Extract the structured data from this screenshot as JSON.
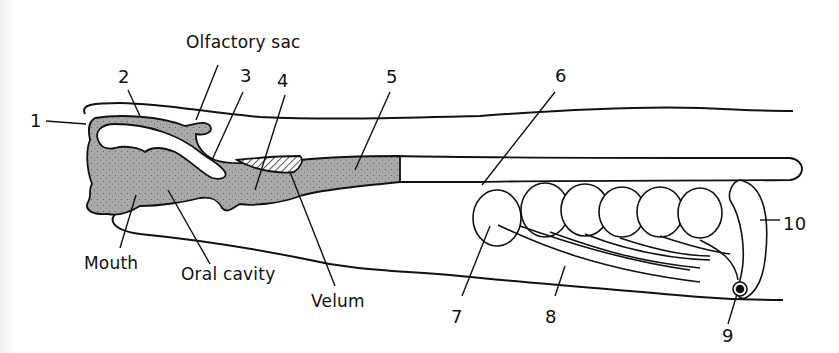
{
  "diagram": {
    "colors": {
      "ink": "#111111",
      "stipple_fill": "#a9a9a9",
      "background": "#ffffff"
    },
    "named_labels": [
      {
        "id": "olfactory-sac",
        "text": "Olfactory sac",
        "x": 186,
        "y": 34
      },
      {
        "id": "mouth",
        "text": "Mouth",
        "x": 84,
        "y": 255
      },
      {
        "id": "oral-cavity",
        "text": "Oral cavity",
        "x": 181,
        "y": 266
      },
      {
        "id": "velum",
        "text": "Velum",
        "x": 311,
        "y": 293
      }
    ],
    "numbered_labels": [
      {
        "id": "1",
        "text": "1",
        "x": 30,
        "y": 112
      },
      {
        "id": "2",
        "text": "2",
        "x": 118,
        "y": 68
      },
      {
        "id": "3",
        "text": "3",
        "x": 240,
        "y": 67
      },
      {
        "id": "4",
        "text": "4",
        "x": 277,
        "y": 72
      },
      {
        "id": "5",
        "text": "5",
        "x": 386,
        "y": 68
      },
      {
        "id": "6",
        "text": "6",
        "x": 555,
        "y": 67
      },
      {
        "id": "7",
        "text": "7",
        "x": 451,
        "y": 308
      },
      {
        "id": "8",
        "text": "8",
        "x": 545,
        "y": 308
      },
      {
        "id": "9",
        "text": "9",
        "x": 722,
        "y": 327
      },
      {
        "id": "10",
        "text": "10",
        "x": 783,
        "y": 215
      }
    ]
  }
}
